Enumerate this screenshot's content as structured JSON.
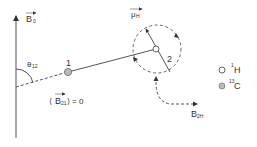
{
  "diagram": {
    "type": "dipolar-coupling-schematic",
    "colors": {
      "line": "#555555",
      "text": "#333333",
      "atom_h_fill": "#ffffff",
      "atom_c_fill": "#bbbbbb",
      "background": "#ffffff"
    },
    "field_axis": {
      "label_main": "B",
      "label_sub": "0",
      "vector": true
    },
    "angle": {
      "symbol": "θ",
      "sub": "12"
    },
    "atoms": [
      {
        "id": "1",
        "label": "1",
        "species": "13C"
      },
      {
        "id": "2",
        "label": "2",
        "species": "1H"
      }
    ],
    "moment": {
      "label_main": "μ",
      "label_sub": "H",
      "vector": true
    },
    "local_field": {
      "label_main": "B",
      "label_sub": "2H",
      "vector": true
    },
    "average_field": {
      "open": "⟨",
      "label_main": "B",
      "label_sub": "21",
      "close": "⟩",
      "equals": "= 0"
    },
    "legend": [
      {
        "marker": "open-circle",
        "sup": "1",
        "text": "H"
      },
      {
        "marker": "filled-circle",
        "sup": "13",
        "text": "C"
      }
    ]
  }
}
